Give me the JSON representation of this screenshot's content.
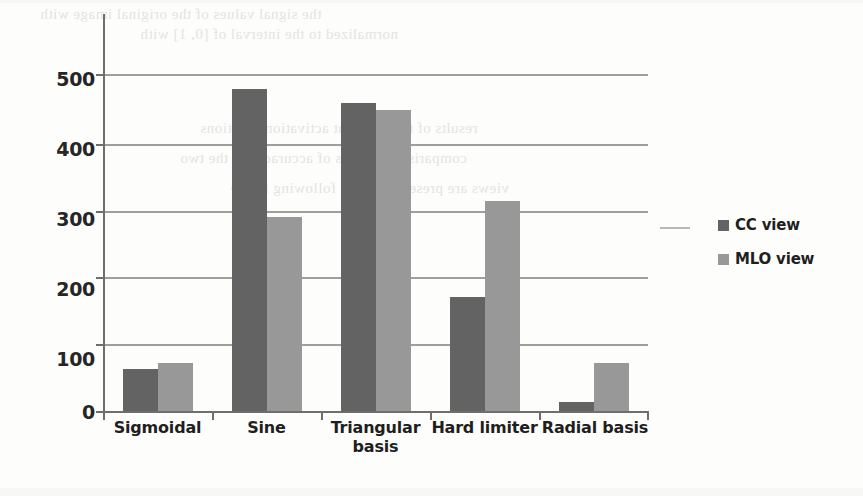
{
  "chart_data": {
    "type": "bar",
    "title": "",
    "subtitle": "",
    "xlabel": "",
    "ylabel": "",
    "categories": [
      "Sigmoidal",
      "Sine",
      "Triangular basis",
      "Hard limiter",
      "Radial basis"
    ],
    "series": [
      {
        "name": "CC view",
        "values": [
          62,
          478,
          457,
          169,
          14
        ],
        "color": "#636363"
      },
      {
        "name": "MLO view",
        "values": [
          71,
          288,
          447,
          312,
          71
        ],
        "color": "#989898"
      }
    ],
    "ylim": [
      0,
      500
    ],
    "yticks": [
      0,
      100,
      200,
      300,
      400,
      500
    ],
    "ytick_labels": [
      "0",
      "100",
      "200",
      "300",
      "400",
      "500"
    ],
    "grid": true,
    "grid_axis": "y",
    "legend_position": "right",
    "legend_entries": [
      "CC view",
      "MLO view"
    ],
    "annotations": []
  },
  "axis": {
    "y_tick_labels": [
      "500",
      "400",
      "300",
      "200",
      "100",
      "0"
    ]
  },
  "category_labels": [
    {
      "line1": "Sigmoidal",
      "line2": ""
    },
    {
      "line1": "Sine",
      "line2": ""
    },
    {
      "line1": "Triangular",
      "line2": "basis"
    },
    {
      "line1": "Hard limiter",
      "line2": ""
    },
    {
      "line1": "Radial basis",
      "line2": ""
    }
  ],
  "legend": {
    "items": [
      {
        "label": "CC view",
        "swatch": "dark-gray-square"
      },
      {
        "label": "MLO view",
        "swatch": "light-gray-square"
      }
    ]
  },
  "colors": {
    "cc_view": "#636363",
    "mlo_view": "#989898",
    "gridline": "#8d8d8a",
    "axis": "#6e6e6b",
    "text": "#1f1f1f",
    "background": "#fdfdfc"
  },
  "scan_artifacts": {
    "bleed_lines": [
      "the signal values of the original image with",
      "normalized to the interval of [0, 1] with",
      "results of the different activation functions",
      "comparison in terms of accuracy for the two",
      "views are presented in the following figure"
    ]
  }
}
